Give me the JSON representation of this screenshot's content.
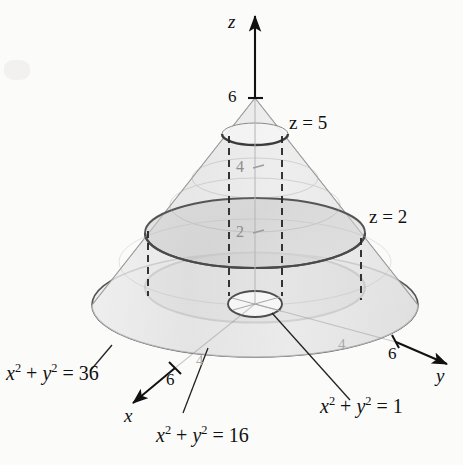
{
  "figure": {
    "background_color": "#fbfbfa",
    "axes": {
      "z": {
        "label": "z",
        "tick_6": "6",
        "tick_4_inner": "4",
        "tick_2_inner": "2"
      },
      "x": {
        "label": "x",
        "tick_6": "6",
        "tick_4": "4"
      },
      "y": {
        "label": "y",
        "tick_6": "6",
        "tick_4": "4"
      }
    },
    "plane_labels": {
      "top": "z = 5",
      "middle": "z = 2"
    },
    "circle_equations": {
      "base": "x2 + y2 = 36",
      "middle": "x2 + y2 = 16",
      "top": "x2 + y2 = 1"
    },
    "colors": {
      "outline": "#4b4b4b",
      "cone_fill": "#e8e8e8",
      "disk_fill": "#c9c9c9",
      "dashed": "#2b2b2b",
      "gray_tick": "#a9a9a9",
      "text": "#111111"
    },
    "geometry": {
      "apex": [
        255,
        98
      ],
      "base_center": [
        255,
        305
      ],
      "base_rx": 163,
      "base_ry": 52,
      "z2_rx": 110,
      "z2_ry": 35,
      "z5_rx": 27,
      "z5_ry": 9,
      "inner_rx": 27,
      "inner_ry": 13
    }
  }
}
